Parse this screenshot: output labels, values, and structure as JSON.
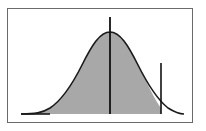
{
  "diagram": {
    "type": "normal-distribution-curve",
    "colors": {
      "frame": "#6a6a6a",
      "curve": "#1a1a1a",
      "shade": "#a8a8a8",
      "background": "#ffffff"
    },
    "mean_line": {
      "label": ""
    },
    "cutoff_line": {
      "label": ""
    }
  }
}
